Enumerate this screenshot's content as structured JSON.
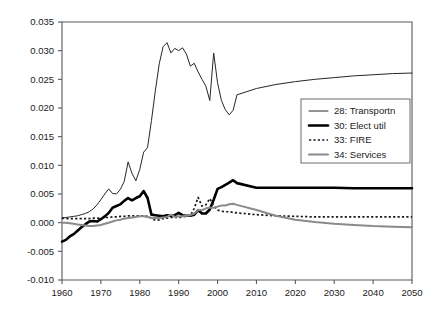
{
  "chart_data": {
    "type": "line",
    "title": "",
    "subtitle": "",
    "xlabel": "",
    "ylabel": "",
    "xlim": [
      1960,
      2050
    ],
    "ylim": [
      -0.01,
      0.035
    ],
    "grid": false,
    "legend_position": "center-right",
    "x_ticks": [
      "1960",
      "1970",
      "1980",
      "1990",
      "2000",
      "2010",
      "2020",
      "2030",
      "2040",
      "2050"
    ],
    "x_tick_values": [
      1960,
      1970,
      1980,
      1990,
      2000,
      2010,
      2020,
      2030,
      2040,
      2050
    ],
    "y_ticks": [
      "0.035",
      "0.030",
      "0.025",
      "0.020",
      "0.015",
      "0.010",
      "0.005",
      "0.000",
      "-0.005",
      "-0.010"
    ],
    "y_tick_values": [
      0.035,
      0.03,
      0.025,
      0.02,
      0.015,
      0.01,
      0.005,
      0.0,
      -0.005,
      -0.01
    ],
    "series": [
      {
        "name": "28: Transportn",
        "key": "transportn",
        "style": "thin-solid",
        "color": "#262626",
        "x": [
          1960,
          1961,
          1962,
          1963,
          1964,
          1965,
          1966,
          1967,
          1968,
          1969,
          1970,
          1971,
          1972,
          1973,
          1974,
          1975,
          1976,
          1977,
          1978,
          1979,
          1980,
          1981,
          1982,
          1983,
          1984,
          1985,
          1986,
          1987,
          1988,
          1989,
          1990,
          1991,
          1992,
          1993,
          1994,
          1995,
          1996,
          1997,
          1998,
          1999,
          2000,
          2001,
          2002,
          2003,
          2004,
          2005,
          2010,
          2015,
          2020,
          2025,
          2030,
          2035,
          2040,
          2045,
          2050
        ],
        "y": [
          0.0008,
          0.0009,
          0.001,
          0.0011,
          0.0012,
          0.0014,
          0.0016,
          0.0019,
          0.0024,
          0.0031,
          0.004,
          0.005,
          0.0059,
          0.0051,
          0.005,
          0.0058,
          0.0072,
          0.0106,
          0.0086,
          0.0073,
          0.0093,
          0.0123,
          0.0131,
          0.0178,
          0.023,
          0.0277,
          0.0307,
          0.0314,
          0.0296,
          0.0304,
          0.03,
          0.0305,
          0.0294,
          0.0273,
          0.0278,
          0.0263,
          0.025,
          0.0238,
          0.0213,
          0.0296,
          0.0244,
          0.0213,
          0.0197,
          0.0188,
          0.0196,
          0.0223,
          0.0234,
          0.0241,
          0.0246,
          0.025,
          0.0253,
          0.0256,
          0.0258,
          0.026,
          0.0261
        ]
      },
      {
        "name": "30: Elect util",
        "key": "electutil",
        "style": "thick-solid",
        "color": "#000000",
        "x": [
          1960,
          1961,
          1962,
          1963,
          1964,
          1965,
          1966,
          1967,
          1968,
          1969,
          1970,
          1971,
          1972,
          1973,
          1974,
          1975,
          1976,
          1977,
          1978,
          1979,
          1980,
          1981,
          1982,
          1983,
          1984,
          1985,
          1986,
          1987,
          1988,
          1989,
          1990,
          1991,
          1992,
          1993,
          1994,
          1995,
          1996,
          1997,
          1998,
          1999,
          2000,
          2001,
          2002,
          2003,
          2004,
          2005,
          2010,
          2015,
          2020,
          2025,
          2030,
          2035,
          2040,
          2045,
          2050
        ],
        "y": [
          -0.0033,
          -0.003,
          -0.0024,
          -0.002,
          -0.0014,
          -0.0008,
          -0.0003,
          0.0002,
          0.0003,
          0.0002,
          0.0006,
          0.0011,
          0.0017,
          0.0026,
          0.0029,
          0.0032,
          0.0038,
          0.0043,
          0.0039,
          0.0043,
          0.0046,
          0.0055,
          0.0043,
          0.0014,
          0.0013,
          0.0012,
          0.0011,
          0.0013,
          0.0012,
          0.0013,
          0.0017,
          0.0013,
          0.0012,
          0.0012,
          0.0014,
          0.0022,
          0.0016,
          0.0016,
          0.0023,
          0.004,
          0.0059,
          0.0062,
          0.0066,
          0.007,
          0.0074,
          0.0069,
          0.0061,
          0.0061,
          0.0061,
          0.0061,
          0.0061,
          0.006,
          0.006,
          0.006,
          0.006
        ]
      },
      {
        "name": "33: FIRE",
        "key": "fire",
        "style": "dotted",
        "color": "#1a1a1a",
        "x": [
          1960,
          1961,
          1962,
          1963,
          1964,
          1965,
          1966,
          1967,
          1968,
          1969,
          1970,
          1971,
          1972,
          1973,
          1974,
          1975,
          1976,
          1977,
          1978,
          1979,
          1980,
          1981,
          1982,
          1983,
          1984,
          1985,
          1986,
          1987,
          1988,
          1989,
          1990,
          1991,
          1992,
          1993,
          1994,
          1995,
          1996,
          1997,
          1998,
          1999,
          2000,
          2001,
          2002,
          2003,
          2004,
          2005,
          2010,
          2015,
          2020,
          2025,
          2030,
          2035,
          2040,
          2045,
          2050
        ],
        "y": [
          0.0008,
          0.0007,
          0.0007,
          0.0007,
          0.0007,
          0.0007,
          0.0007,
          0.0007,
          0.0008,
          0.0008,
          0.0008,
          0.0009,
          0.0009,
          0.001,
          0.001,
          0.0011,
          0.0011,
          0.0012,
          0.0012,
          0.0012,
          0.0012,
          0.0012,
          0.0011,
          0.0008,
          0.0004,
          0.0005,
          0.0007,
          0.0008,
          0.0009,
          0.0009,
          0.0009,
          0.001,
          0.0011,
          0.0012,
          0.0025,
          0.0044,
          0.0029,
          0.0031,
          0.0042,
          0.003,
          0.0022,
          0.002,
          0.0019,
          0.0019,
          0.0018,
          0.0017,
          0.0014,
          0.0012,
          0.0011,
          0.001,
          0.001,
          0.001,
          0.001,
          0.001,
          0.001
        ]
      },
      {
        "name": "34: Services",
        "key": "services",
        "style": "gray-solid",
        "color": "#8a8a8c",
        "x": [
          1960,
          1961,
          1962,
          1963,
          1964,
          1965,
          1966,
          1967,
          1968,
          1969,
          1970,
          1971,
          1972,
          1973,
          1974,
          1975,
          1976,
          1977,
          1978,
          1979,
          1980,
          1981,
          1982,
          1983,
          1984,
          1985,
          1986,
          1987,
          1988,
          1989,
          1990,
          1991,
          1992,
          1993,
          1994,
          1995,
          1996,
          1997,
          1998,
          1999,
          2000,
          2001,
          2002,
          2003,
          2004,
          2005,
          2010,
          2015,
          2020,
          2025,
          2030,
          2035,
          2040,
          2045,
          2050
        ],
        "y": [
          0.0,
          0.0,
          -0.0001,
          -0.0002,
          -0.0003,
          -0.0004,
          -0.0005,
          -0.0006,
          -0.0006,
          -0.0005,
          -0.0004,
          -0.0002,
          0.0,
          0.0002,
          0.0004,
          0.0005,
          0.0007,
          0.0008,
          0.0009,
          0.001,
          0.0011,
          0.0011,
          0.001,
          0.0008,
          0.0008,
          0.0008,
          0.0009,
          0.001,
          0.0014,
          0.001,
          0.0011,
          0.0011,
          0.0012,
          0.0013,
          0.0016,
          0.0022,
          0.0022,
          0.0025,
          0.0026,
          0.0026,
          0.0028,
          0.003,
          0.003,
          0.0032,
          0.0033,
          0.0031,
          0.0022,
          0.0012,
          0.0005,
          0.0001,
          -0.0002,
          -0.0004,
          -0.0006,
          -0.0007,
          -0.0008
        ]
      }
    ]
  },
  "legend": {
    "items": [
      {
        "label": "28: Transportn",
        "key": "transportn"
      },
      {
        "label": "30: Elect util",
        "key": "electutil"
      },
      {
        "label": "33: FIRE",
        "key": "fire"
      },
      {
        "label": "34: Services",
        "key": "services"
      }
    ]
  },
  "colors": {
    "axis": "#58585a",
    "text": "#1a1a1a",
    "background": "#ffffff",
    "transportn": "#262626",
    "electutil": "#000000",
    "fire": "#1a1a1a",
    "services": "#8a8a8c"
  }
}
